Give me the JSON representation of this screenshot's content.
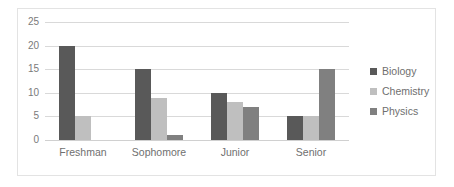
{
  "chart_data": {
    "type": "bar",
    "title": "",
    "subtitle": "",
    "xlabel": "",
    "ylabel": "",
    "categories": [
      "Freshman",
      "Sophomore",
      "Junior",
      "Senior"
    ],
    "series": [
      {
        "name": "Biology",
        "color": "#595959",
        "values": [
          20,
          15,
          10,
          5
        ]
      },
      {
        "name": "Chemistry",
        "color": "#bfbfbf",
        "values": [
          5,
          9,
          8,
          5
        ]
      },
      {
        "name": "Physics",
        "color": "#808080",
        "values": [
          0,
          1,
          7,
          15
        ]
      }
    ],
    "ylim": [
      0,
      25
    ],
    "ytick_labels": [
      "0",
      "5",
      "10",
      "15",
      "20",
      "25"
    ],
    "ytick_values": [
      0,
      5,
      10,
      15,
      20,
      25
    ],
    "grid": true,
    "grid_axis": "y",
    "legend_position": "right",
    "annotations": []
  },
  "style": {
    "background": "#ffffff",
    "border_color": "#e3e3e3",
    "gridline_color": "#d9d9d9",
    "tick_label_color": "#7a7a7a",
    "category_label_color": "#6f6f6f",
    "legend_label_color": "#6f6f6f"
  }
}
